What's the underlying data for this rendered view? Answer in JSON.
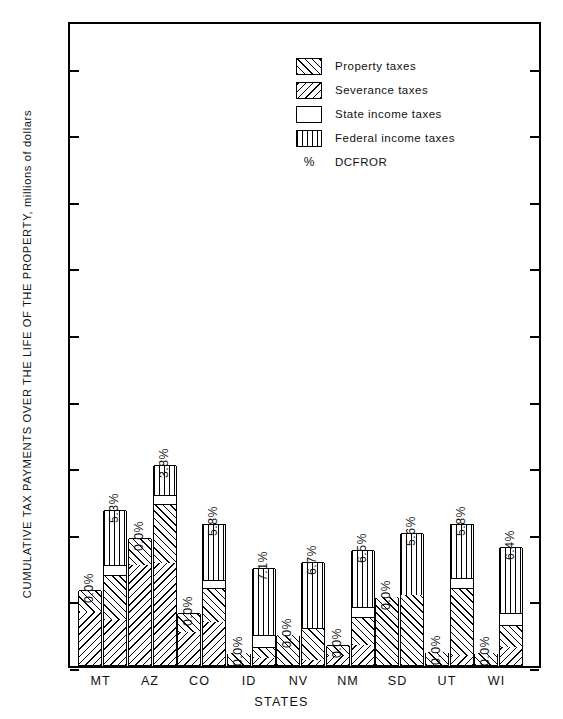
{
  "chart_data": {
    "type": "bar",
    "title": "",
    "xlabel": "STATES",
    "ylabel": "CUMULATIVE TAX PAYMENTS OVER THE LIFE OF THE PROPERTY, millions of dollars",
    "ylim": [
      0,
      380
    ],
    "yticks": [
      0,
      40,
      80,
      120,
      160,
      200,
      240,
      280,
      320,
      360
    ],
    "ytick_labels": [
      "0",
      "40",
      "80",
      "120",
      "160",
      "200",
      "240",
      "280",
      "320",
      "360"
    ],
    "grid": false,
    "legend_position": "top-center",
    "stacked": true,
    "bars_per_category": 2,
    "categories": [
      "MT",
      "AZ",
      "CO",
      "ID",
      "NV",
      "NM",
      "SD",
      "UT",
      "WI"
    ],
    "segment_names": [
      "Property taxes",
      "Severance taxes",
      "State income taxes",
      "Federal income taxes"
    ],
    "series": [
      {
        "name": "Property taxes",
        "values_bar1": [
          13,
          16,
          11,
          7,
          18,
          6,
          41,
          8,
          7
        ],
        "values_bar2": [
          27,
          36,
          20,
          7,
          19,
          17,
          42,
          40,
          13
        ]
      },
      {
        "name": "Severance taxes",
        "values_bar1": [
          32,
          60,
          20,
          0,
          0,
          6,
          0,
          0,
          0
        ],
        "values_bar2": [
          27,
          61,
          26,
          4,
          3,
          12,
          0,
          6,
          11
        ]
      },
      {
        "name": "State income taxes",
        "values_bar1": [
          0,
          0,
          0,
          0,
          0,
          0,
          0,
          0,
          0
        ],
        "values_bar2": [
          6,
          5,
          5,
          7,
          0,
          6,
          0,
          6,
          7
        ]
      },
      {
        "name": "Federal income taxes",
        "values_bar1": [
          0,
          0,
          0,
          0,
          0,
          0,
          0,
          0,
          0
        ],
        "values_bar2": [
          33,
          18,
          34,
          40,
          40,
          34,
          37,
          33,
          40
        ]
      }
    ],
    "totals_bar1": [
      45,
      76,
      31,
      7,
      18,
      12,
      41,
      8,
      7
    ],
    "totals_bar2": [
      93,
      120,
      85,
      58,
      62,
      69,
      79,
      85,
      71
    ],
    "dcfror_bar1": [
      "0.0%",
      "0.0%",
      "0.0%",
      "0.0%",
      "0.0%",
      "0.0%",
      "0.0%",
      "0.0%",
      "0.0%"
    ],
    "dcfror_bar2": [
      "5.3%",
      "3.8%",
      "5.8%",
      "7.1%",
      "6.7%",
      "6.5%",
      "5.6%",
      "5.8%",
      "6.4%"
    ]
  },
  "legend": {
    "items": [
      {
        "label": "Property taxes",
        "pattern": "property"
      },
      {
        "label": "Severance taxes",
        "pattern": "severance"
      },
      {
        "label": "State income taxes",
        "pattern": "state"
      },
      {
        "label": "Federal income taxes",
        "pattern": "federal"
      }
    ],
    "dcfror_symbol": "%",
    "dcfror_label": "DCFROR"
  },
  "colors": {
    "ink": "#000000",
    "background": "#ffffff"
  }
}
